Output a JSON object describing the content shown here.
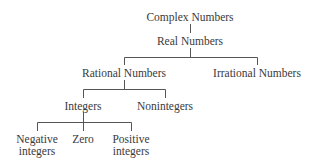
{
  "diagram": {
    "type": "tree",
    "line_color": "#555555",
    "nodes": {
      "complex": {
        "label": "Complex Numbers"
      },
      "real": {
        "label": "Real Numbers"
      },
      "rational": {
        "label": "Rational Numbers"
      },
      "irrational": {
        "label": "Irrational Numbers"
      },
      "integers": {
        "label": "Integers"
      },
      "nonintegers": {
        "label": "Nonintegers"
      },
      "negative": {
        "line1": "Negative",
        "line2": "integers"
      },
      "zero": {
        "label": "Zero"
      },
      "positive": {
        "line1": "Positive",
        "line2": "integers"
      }
    },
    "edges": [
      [
        "Complex Numbers",
        "Real Numbers"
      ],
      [
        "Real Numbers",
        "Rational Numbers"
      ],
      [
        "Real Numbers",
        "Irrational Numbers"
      ],
      [
        "Rational Numbers",
        "Integers"
      ],
      [
        "Rational Numbers",
        "Nonintegers"
      ],
      [
        "Integers",
        "Negative integers"
      ],
      [
        "Integers",
        "Zero"
      ],
      [
        "Integers",
        "Positive integers"
      ]
    ]
  }
}
